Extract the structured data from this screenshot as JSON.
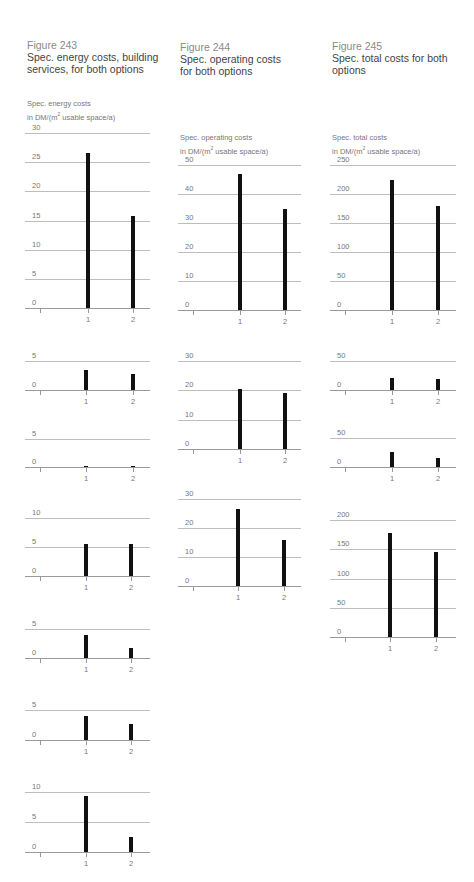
{
  "figures": [
    {
      "number": "Figure 243",
      "title_line1": "Spec. energy costs, building",
      "title_line2": "services, for both options",
      "unit_line1": "Spec. energy costs",
      "unit_line2_pre": "in DM/(m",
      "unit_sup": "2",
      "unit_line2_post": " usable space/a)"
    },
    {
      "number": "Figure 244",
      "title_line1": "Spec. operating costs",
      "title_line2": "for both options",
      "unit_line1": "Spec. operating costs",
      "unit_line2_pre": "in DM/(m",
      "unit_sup": "2",
      "unit_line2_post": " usable space/a)"
    },
    {
      "number": "Figure 245",
      "title_line1": "Spec. total costs for both",
      "title_line2": "options",
      "unit_line1": "Spec. total costs",
      "unit_line2_pre": "in DM/(m",
      "unit_sup": "2",
      "unit_line2_post": " usable space/a)"
    }
  ],
  "x_labels": [
    "1",
    "2"
  ],
  "chart_data": [
    {
      "figure": "Figure 243",
      "type": "bar",
      "title": "Total",
      "categories": [
        "1",
        "2"
      ],
      "values": [
        26.5,
        15.8
      ],
      "yticks": [
        0,
        5,
        10,
        15,
        20,
        25,
        30
      ],
      "ylim": [
        0,
        30
      ],
      "ylabel": "Spec. energy costs in DM/(m2 usable space/a)",
      "grid": true
    },
    {
      "figure": "Figure 243",
      "type": "bar",
      "title": "Pumps",
      "categories": [
        "1",
        "2"
      ],
      "values": [
        3.5,
        2.8
      ],
      "yticks": [
        0,
        5
      ],
      "ylim": [
        0,
        5
      ],
      "grid": true
    },
    {
      "figure": "Figure 243",
      "type": "bar",
      "title": "Humidification",
      "categories": [
        "1",
        "2"
      ],
      "values": [
        0.1,
        0.1
      ],
      "yticks": [
        0,
        5
      ],
      "ylim": [
        0,
        5
      ],
      "grid": true
    },
    {
      "figure": "Figure 243",
      "type": "bar",
      "title": "Lighting",
      "categories": [
        "1",
        "2"
      ],
      "values": [
        5.5,
        5.6
      ],
      "yticks": [
        0,
        5,
        10
      ],
      "ylim": [
        0,
        10
      ],
      "grid": true
    },
    {
      "figure": "Figure 243",
      "type": "bar",
      "title": "Cooling",
      "categories": [
        "1",
        "2"
      ],
      "values": [
        4.0,
        1.8
      ],
      "yticks": [
        0,
        5
      ],
      "ylim": [
        0,
        5
      ],
      "grid": true
    },
    {
      "figure": "Figure 243",
      "type": "bar",
      "title": "Heating",
      "categories": [
        "1",
        "2"
      ],
      "values": [
        4.0,
        2.7
      ],
      "yticks": [
        0,
        5
      ],
      "ylim": [
        0,
        5
      ],
      "grid": true
    },
    {
      "figure": "Figure 243",
      "type": "bar",
      "title": "Ventilation",
      "categories": [
        "1",
        "2"
      ],
      "values": [
        9.3,
        2.5
      ],
      "yticks": [
        0,
        5,
        10
      ],
      "ylim": [
        0,
        10
      ],
      "grid": true
    },
    {
      "figure": "Figure 244",
      "type": "bar",
      "title": "Total",
      "categories": [
        "1",
        "2"
      ],
      "values": [
        47,
        35
      ],
      "yticks": [
        0,
        10,
        20,
        30,
        40,
        50
      ],
      "ylim": [
        0,
        50
      ],
      "ylabel": "Spec. operating costs in DM/(m2 usable space/a)",
      "grid": true
    },
    {
      "figure": "Figure 244",
      "type": "bar",
      "title": "Maintenance + repairs",
      "categories": [
        "1",
        "2"
      ],
      "values": [
        20.3,
        19.0
      ],
      "yticks": [
        0,
        10,
        20,
        30
      ],
      "ylim": [
        0,
        30
      ],
      "grid": true
    },
    {
      "figure": "Figure 244",
      "type": "bar",
      "title": "Energy costs",
      "categories": [
        "1",
        "2"
      ],
      "values": [
        26.5,
        15.8
      ],
      "yticks": [
        0,
        10,
        20,
        30
      ],
      "ylim": [
        0,
        30
      ],
      "grid": true
    },
    {
      "figure": "Figure 245",
      "type": "bar",
      "title": "Total",
      "categories": [
        "1",
        "2"
      ],
      "values": [
        225,
        180
      ],
      "yticks": [
        0,
        50,
        100,
        150,
        200,
        250
      ],
      "ylim": [
        0,
        250
      ],
      "ylabel": "Spec. total costs in DM/(m2 usable space/a)",
      "grid": true
    },
    {
      "figure": "Figure 245",
      "type": "bar",
      "title": "Maintenance + repairs",
      "categories": [
        "1",
        "2"
      ],
      "values": [
        20,
        19
      ],
      "yticks": [
        0,
        50
      ],
      "ylim": [
        0,
        50
      ],
      "grid": true
    },
    {
      "figure": "Figure 245",
      "type": "bar",
      "title": "Energy costs",
      "categories": [
        "1",
        "2"
      ],
      "values": [
        26,
        16
      ],
      "yticks": [
        0,
        50
      ],
      "ylim": [
        0,
        50
      ],
      "grid": true
    },
    {
      "figure": "Figure 245",
      "type": "bar",
      "title": "Capital costs",
      "categories": [
        "1",
        "2"
      ],
      "values": [
        178,
        145
      ],
      "yticks": [
        0,
        50,
        100,
        150,
        200
      ],
      "ylim": [
        0,
        200
      ],
      "grid": true
    }
  ]
}
